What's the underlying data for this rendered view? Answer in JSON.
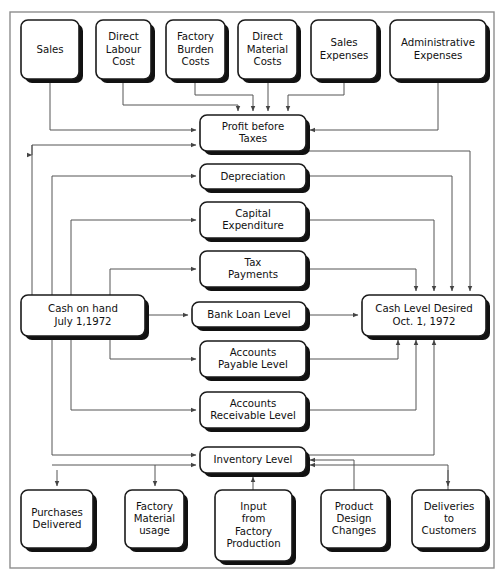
{
  "diagram": {
    "frame": {
      "x": 10,
      "y": 12,
      "width": 484,
      "height": 556,
      "stroke": "#8d8d8d"
    },
    "style": {
      "box_fill": "#ffffff",
      "box_stroke": "#1a1a1a",
      "shadow_color": "#111111",
      "connector_color": "#555555",
      "text_color": "#111111"
    },
    "nodes": [
      {
        "id": "sales",
        "label": "Sales",
        "lines": [
          "Sales"
        ],
        "x": 21,
        "y": 20,
        "w": 58,
        "h": 59
      },
      {
        "id": "direct-labour",
        "label": "Direct Labour Cost",
        "lines": [
          "Direct",
          "Labour",
          "Cost"
        ],
        "x": 96,
        "y": 20,
        "w": 55,
        "h": 59
      },
      {
        "id": "factory-burden",
        "label": "Factory Burden Costs",
        "lines": [
          "Factory",
          "Burden",
          "Costs"
        ],
        "x": 166,
        "y": 20,
        "w": 59,
        "h": 59
      },
      {
        "id": "direct-material",
        "label": "Direct Material Costs",
        "lines": [
          "Direct",
          "Material",
          "Costs"
        ],
        "x": 238,
        "y": 20,
        "w": 59,
        "h": 59
      },
      {
        "id": "sales-expenses",
        "label": "Sales Expenses",
        "lines": [
          "Sales",
          "Expenses"
        ],
        "x": 311,
        "y": 20,
        "w": 66,
        "h": 59
      },
      {
        "id": "admin-expenses",
        "label": "Administrative Expenses",
        "lines": [
          "Administrative",
          "Expenses"
        ],
        "x": 390,
        "y": 20,
        "w": 96,
        "h": 59
      },
      {
        "id": "profit-before-taxes",
        "label": "Profit before Taxes",
        "lines": [
          "Profit before",
          "Taxes"
        ],
        "x": 200,
        "y": 115,
        "w": 106,
        "h": 36
      },
      {
        "id": "depreciation",
        "label": "Depreciation",
        "lines": [
          "Depreciation"
        ],
        "x": 200,
        "y": 164,
        "w": 106,
        "h": 25
      },
      {
        "id": "capital-expenditure",
        "label": "Capital Expenditure",
        "lines": [
          "Capital",
          "Expenditure"
        ],
        "x": 200,
        "y": 202,
        "w": 106,
        "h": 36
      },
      {
        "id": "tax-payments",
        "label": "Tax Payments",
        "lines": [
          "Tax",
          "Payments"
        ],
        "x": 200,
        "y": 251,
        "w": 106,
        "h": 36
      },
      {
        "id": "cash-on-hand",
        "label": "Cash on hand July 1,1972",
        "lines": [
          "Cash on hand",
          "July 1,1972"
        ],
        "x": 21,
        "y": 295,
        "w": 124,
        "h": 41
      },
      {
        "id": "bank-loan-level",
        "label": "Bank Loan Level",
        "lines": [
          "Bank Loan Level"
        ],
        "x": 192,
        "y": 302,
        "w": 114,
        "h": 25
      },
      {
        "id": "cash-level-desired",
        "label": "Cash Level Desired Oct. 1, 1972",
        "lines": [
          "Cash Level Desired",
          "Oct. 1, 1972"
        ],
        "x": 362,
        "y": 295,
        "w": 124,
        "h": 41
      },
      {
        "id": "accounts-payable",
        "label": "Accounts Payable Level",
        "lines": [
          "Accounts",
          "Payable Level"
        ],
        "x": 200,
        "y": 341,
        "w": 106,
        "h": 36
      },
      {
        "id": "accounts-receivable",
        "label": "Accounts Receivable Level",
        "lines": [
          "Accounts",
          "Receivable Level"
        ],
        "x": 200,
        "y": 392,
        "w": 106,
        "h": 36
      },
      {
        "id": "inventory-level",
        "label": "Inventory Level",
        "lines": [
          "Inventory Level"
        ],
        "x": 200,
        "y": 447,
        "w": 106,
        "h": 26
      },
      {
        "id": "purchases-delivered",
        "label": "Purchases Delivered",
        "lines": [
          "Purchases",
          "Delivered"
        ],
        "x": 21,
        "y": 490,
        "w": 72,
        "h": 58
      },
      {
        "id": "factory-material-usage",
        "label": "Factory Material usage",
        "lines": [
          "Factory",
          "Material",
          "usage"
        ],
        "x": 125,
        "y": 490,
        "w": 59,
        "h": 58
      },
      {
        "id": "input-from-factory-production",
        "label": "Input from Factory Production",
        "lines": [
          "Input",
          "from",
          "Factory",
          "Production"
        ],
        "x": 215,
        "y": 490,
        "w": 77,
        "h": 71
      },
      {
        "id": "product-design-changes",
        "label": "Product Design Changes",
        "lines": [
          "Product",
          "Design",
          "Changes"
        ],
        "x": 321,
        "y": 490,
        "w": 66,
        "h": 58
      },
      {
        "id": "deliveries-to-customers",
        "label": "Deliveries to Customers",
        "lines": [
          "Deliveries",
          "to",
          "Customers"
        ],
        "x": 412,
        "y": 490,
        "w": 74,
        "h": 58
      }
    ],
    "connectors": [
      {
        "id": "sales-to-profit",
        "from": "sales",
        "to": "profit-before-taxes",
        "path": "M50,79 L50,130 L196,130"
      },
      {
        "id": "direct-labour-to-profit",
        "from": "direct-labour",
        "to": "profit-before-taxes",
        "path": "M123,79 L123,105 L238,105 L238,111"
      },
      {
        "id": "factory-burden-to-profit",
        "from": "factory-burden",
        "to": "profit-before-taxes",
        "path": "M195,79 L195,95 L253,95 L253,111"
      },
      {
        "id": "direct-material-to-profit",
        "from": "direct-material",
        "to": "profit-before-taxes",
        "path": "M268,79 L268,111"
      },
      {
        "id": "sales-expenses-to-profit",
        "from": "sales-expenses",
        "to": "profit-before-taxes",
        "path": "M344,79 L344,95 L288,95 L288,111"
      },
      {
        "id": "admin-expenses-to-profit",
        "from": "admin-expenses",
        "to": "profit-before-taxes",
        "path": "M438,79 L438,130 L310,130"
      },
      {
        "id": "cash-on-hand-to-profit",
        "from": "cash-on-hand",
        "to": "profit-before-taxes",
        "path": "M32,295 L32,145 L196,145"
      },
      {
        "id": "profit-to-cash-level",
        "from": "profit-before-taxes",
        "to": "cash-level-desired",
        "path": "M306,151 L470,151 L470,291"
      },
      {
        "id": "depreciation-to-cash-level",
        "from": "depreciation",
        "to": "cash-level-desired",
        "path": "M306,176 L452,176 L452,291"
      },
      {
        "id": "capital-expenditure-to-cash",
        "from": "capital-expenditure",
        "to": "cash-level-desired",
        "path": "M306,220 L434,220 L434,291"
      },
      {
        "id": "tax-payments-to-cash-level",
        "from": "tax-payments",
        "to": "cash-level-desired",
        "path": "M306,269 L416,269 L416,291"
      },
      {
        "id": "cash-on-hand-to-depreciation",
        "from": "cash-on-hand",
        "to": "depreciation",
        "path": "M52,295 L52,176 L196,176"
      },
      {
        "id": "cash-on-hand-to-capital",
        "from": "cash-on-hand",
        "to": "capital-expenditure",
        "path": "M71,295 L71,220 L196,220"
      },
      {
        "id": "cash-on-hand-to-tax",
        "from": "cash-on-hand",
        "to": "tax-payments",
        "path": "M110,295 L110,269 L196,269"
      },
      {
        "id": "cash-on-hand-to-bank-loan",
        "from": "cash-on-hand",
        "to": "bank-loan-level",
        "path": "M145,315 L188,315"
      },
      {
        "id": "bank-loan-to-cash-level",
        "from": "bank-loan-level",
        "to": "cash-level-desired",
        "path": "M306,315 L358,315"
      },
      {
        "id": "cash-on-hand-to-payable",
        "from": "cash-on-hand",
        "to": "accounts-payable",
        "path": "M110,336 L110,359 L196,359"
      },
      {
        "id": "cash-on-hand-to-receivable",
        "from": "cash-on-hand",
        "to": "accounts-receivable",
        "path": "M71,336 L71,410 L196,410"
      },
      {
        "id": "payable-to-cash-level",
        "from": "accounts-payable",
        "to": "cash-level-desired",
        "path": "M306,359 L398,359 L398,340"
      },
      {
        "id": "receivable-to-cash-level",
        "from": "accounts-receivable",
        "to": "cash-level-desired",
        "path": "M306,410 L416,410 L416,340"
      },
      {
        "id": "inventory-to-cash-level",
        "from": "inventory-level",
        "to": "cash-level-desired",
        "path": "M306,455 L434,455 L434,340"
      },
      {
        "id": "cash-on-hand-to-inventory",
        "from": "cash-on-hand",
        "to": "inventory-level",
        "path": "M52,336 L52,455 L196,455"
      },
      {
        "id": "profit-to-inventory",
        "from": "profit-before-taxes",
        "to": "inventory-level",
        "path": "M32,145 L32,155 L32,155"
      },
      {
        "id": "left-rail-to-inventory",
        "from": "cash-on-hand",
        "to": "inventory-level",
        "path": "M52,465 L196,465"
      },
      {
        "id": "deliveries-to-inventory",
        "from": "deliveries-to-customers",
        "to": "inventory-level",
        "path": "M448,490 L448,465 L310,465"
      },
      {
        "id": "product-design-to-inventory",
        "from": "product-design-changes",
        "to": "inventory-level",
        "path": "M354,490 L354,460 L310,460"
      },
      {
        "id": "input-factory-to-inventory",
        "from": "input-from-factory-production",
        "to": "inventory-level",
        "path": "M253,490 L253,477"
      },
      {
        "id": "inventory-to-factory-material",
        "from": "inventory-level",
        "to": "factory-material-usage",
        "path": "M155,465 L155,478 L155,486"
      },
      {
        "id": "inventory-to-purchases",
        "from": "inventory-level",
        "to": "purchases-delivered",
        "path": "M57,470 L57,486"
      },
      {
        "id": "inventory-to-deliveries",
        "from": "inventory-level",
        "to": "deliveries-to-customers",
        "path": "M448,470 L448,486"
      }
    ]
  }
}
